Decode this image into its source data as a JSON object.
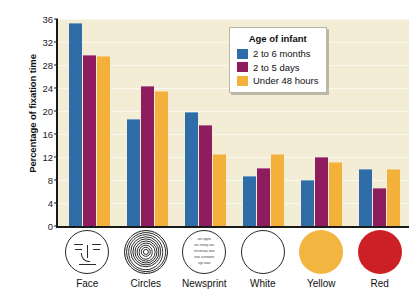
{
  "chart_data": {
    "type": "bar",
    "title": "",
    "xlabel": "",
    "ylabel": "Percentage of fixation time",
    "ylim": [
      0,
      36
    ],
    "yticks": [
      0,
      4,
      8,
      12,
      16,
      20,
      24,
      28,
      32,
      36
    ],
    "grid": true,
    "legend_position": "top-right",
    "legend_title": "Age of infant",
    "categories": [
      "Face",
      "Circles",
      "Newsprint",
      "White",
      "Yellow",
      "Red"
    ],
    "series": [
      {
        "name": "2 to 6 months",
        "color": "#2f6da8",
        "values": [
          35.3,
          18.6,
          19.8,
          8.7,
          8.0,
          9.9
        ]
      },
      {
        "name": "2 to 5 days",
        "color": "#8e1c5e",
        "values": [
          29.7,
          24.3,
          17.6,
          10.1,
          12.0,
          6.6
        ]
      },
      {
        "name": "Under 48 hours",
        "color": "#f3b13c",
        "values": [
          29.6,
          23.5,
          12.5,
          12.5,
          11.1,
          9.9
        ]
      }
    ]
  },
  "axis": {
    "y_title": "Percentage of fixation time"
  },
  "legend": {
    "title": "Age of infant",
    "items": [
      {
        "label": "2 to 6 months",
        "color": "#2f6da8"
      },
      {
        "label": "2 to 5 days",
        "color": "#8e1c5e"
      },
      {
        "label": "Under 48 hours",
        "color": "#f3b13c"
      }
    ]
  },
  "x_axis": {
    "categories": [
      {
        "label": "Face",
        "icon": "face-icon",
        "style": "outline",
        "fill": "#ffffff"
      },
      {
        "label": "Circles",
        "icon": "concentric-circles-icon",
        "style": "outline",
        "fill": "#ffffff"
      },
      {
        "label": "Newsprint",
        "icon": "newsprint-icon",
        "style": "outline",
        "fill": "#ffffff"
      },
      {
        "label": "White",
        "icon": "white-disc-icon",
        "style": "outline",
        "fill": "#ffffff"
      },
      {
        "label": "Yellow",
        "icon": "yellow-disc-icon",
        "style": "filled",
        "fill": "#f2b53f"
      },
      {
        "label": "Red",
        "icon": "red-disc-icon",
        "style": "filled",
        "fill": "#cc2026"
      }
    ]
  },
  "newsprint_text": [
    "oes apple",
    "ed, honey, wat",
    "ern bread, who",
    "ead, sunflower",
    "ugh flake"
  ],
  "colors": {
    "plot_background": "#f4edd5",
    "page_background": "#ffffff",
    "axis": "#1a1a1a",
    "gridline": "#fffbe9"
  }
}
